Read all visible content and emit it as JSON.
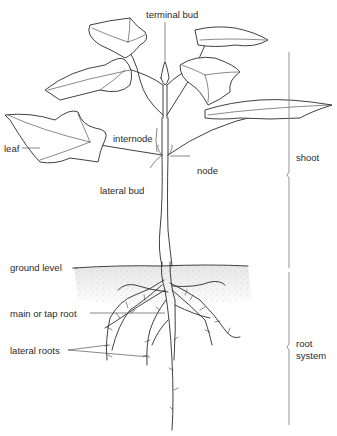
{
  "diagram": {
    "labels": {
      "terminal_bud": "terminal bud",
      "internode": "internode",
      "leaf": "leaf",
      "node": "node",
      "lateral_bud": "lateral bud",
      "ground_level": "ground level",
      "main_root": "main or tap root",
      "lateral_roots": "lateral roots"
    },
    "regions": {
      "shoot": "shoot",
      "root_system_line1": "root",
      "root_system_line2": "system"
    }
  }
}
